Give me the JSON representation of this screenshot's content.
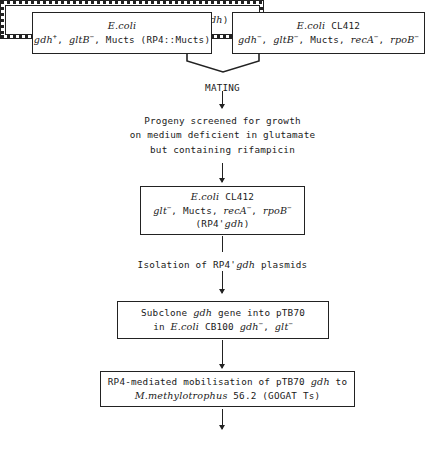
{
  "diagram": {
    "parent_left": {
      "line1_species": "E.coli",
      "line2_prefix": "gdh",
      "line2_sup1": "+",
      "line2_mid": ", ",
      "line2_gene2": "gltB",
      "line2_sup2": "−",
      "line2_rest": ", Mucts (RP4::Mucts)"
    },
    "parent_right": {
      "line1_species": "E.coli",
      "line1_strain": " CL412",
      "g1": "gdh",
      "g1sup": "−",
      "sep1": ", ",
      "g2": "gltB",
      "g2sup": "−",
      "sep2": ", Mucts, ",
      "g3": "recA",
      "g3sup": "−",
      "sep3": ", ",
      "g4": "rpoB",
      "g4sup": "−"
    },
    "mating_label": "MATING",
    "screening_text": {
      "line1": "Progeny screened for growth",
      "line2": "on medium deficient in glutamate",
      "line3": "but containing rifampicin"
    },
    "recombinant_box": {
      "line1_species": "E.coli",
      "line1_strain": " CL412",
      "g1": "glt",
      "g1sup": "−",
      "sep1": ", Mucts, ",
      "g2": "recA",
      "g2sup": "−",
      "sep2": ", ",
      "g3": "rpoB",
      "g3sup": "−",
      "line3_pre": "(RP4'",
      "line3_gene": "gdh",
      "line3_post": ")"
    },
    "isolation_text": {
      "pre": "Isolation of RP4'",
      "gene": "gdh",
      "post": " plasmids"
    },
    "subclone_box": {
      "l1_pre": "Subclone ",
      "l1_gene": "gdh",
      "l1_post": " gene into pTB70",
      "l2_pre": "in ",
      "l2_species": "E.coli",
      "l2_mid": " CB100 ",
      "l2_g1": "gdh",
      "l2_g1sup": "−",
      "l2_sep": ", ",
      "l2_g2": "glt",
      "l2_g2sup": "−"
    },
    "mobilisation_box": {
      "l1_pre": "RP4-mediated mobilisation of pTB70 ",
      "l1_gene": "gdh",
      "l1_post": " to",
      "l2_species": "M.methylotrophus",
      "l2_post": " 56.2 (GOGAT Ts)"
    },
    "final_box": {
      "species": "M.methylotrophus",
      "post_pre": " 56.2 (pTB70 ",
      "gene": "gdh",
      "post": ")"
    }
  }
}
